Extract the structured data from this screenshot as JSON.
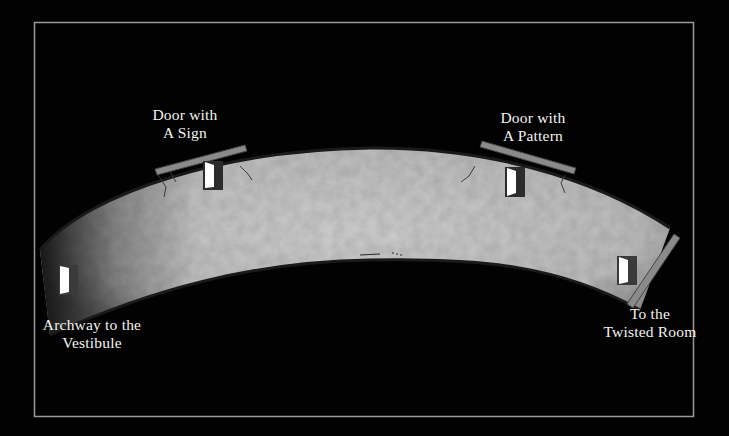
{
  "map": {
    "title": "Corridor map",
    "frame": {
      "x": 34,
      "y": 22,
      "width": 659,
      "height": 394,
      "color": "#9a9a9a"
    },
    "colors": {
      "background": "#020202",
      "floor": "#c4c4c4",
      "floor_dark": "#7a7a7a",
      "wall": "#8a8a8a",
      "door_fill": "#ffffff",
      "door_frame": "#3a3a3a",
      "label": "#f2f2f2"
    }
  },
  "locations": [
    {
      "id": "door-with-a-sign",
      "line1": "Door with",
      "line2": "A Sign"
    },
    {
      "id": "door-with-a-pattern",
      "line1": "Door with",
      "line2": "A Pattern"
    },
    {
      "id": "archway-to-vestibule",
      "line1": "Archway to the",
      "line2": "Vestibule"
    },
    {
      "id": "to-twisted-room",
      "line1": "To the",
      "line2": "Twisted Room"
    }
  ]
}
